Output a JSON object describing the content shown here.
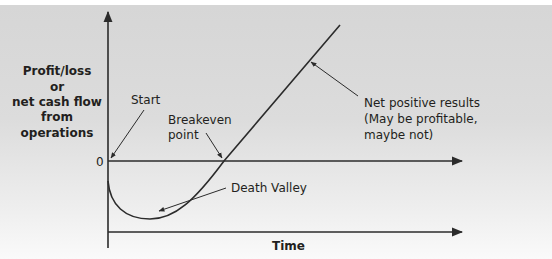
{
  "diagram": {
    "title": "",
    "y_axis_label": [
      "Profit/loss",
      "or",
      "net cash flow",
      "from",
      "operations"
    ],
    "x_axis_label": "Time",
    "zero_label": "0",
    "annotations": {
      "start": [
        "Start"
      ],
      "breakeven": [
        "Breakeven",
        "point"
      ],
      "death_valley": [
        "Death Valley"
      ],
      "net_positive": [
        "Net positive results",
        "(May be profitable,",
        "maybe not)"
      ]
    },
    "colors": {
      "line": "#2b2b2b",
      "text": "#231f20"
    }
  }
}
